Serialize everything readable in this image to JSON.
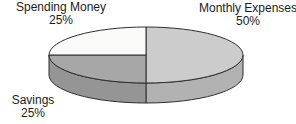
{
  "chart_data": {
    "type": "pie",
    "style": "3d",
    "title": "",
    "legend_position": "none",
    "label_style": "outside-callouts-with-percent",
    "direction": "clockwise",
    "start_angle_deg": -90,
    "background_color": "#ffffff",
    "outline_color": "#2f2f2f",
    "slices": [
      {
        "label": "Monthly Expenses",
        "value": 50,
        "percent_label": "50%",
        "top_color": "#cccccc",
        "side_color": "#b2b2b2"
      },
      {
        "label": "Savings",
        "value": 25,
        "percent_label": "25%",
        "top_color": "#a7a7a7",
        "side_color": "#959595"
      },
      {
        "label": "Spending Money",
        "value": 25,
        "percent_label": "25%",
        "top_color": "#fafaf8",
        "side_color": "#e0e0e0"
      }
    ]
  }
}
